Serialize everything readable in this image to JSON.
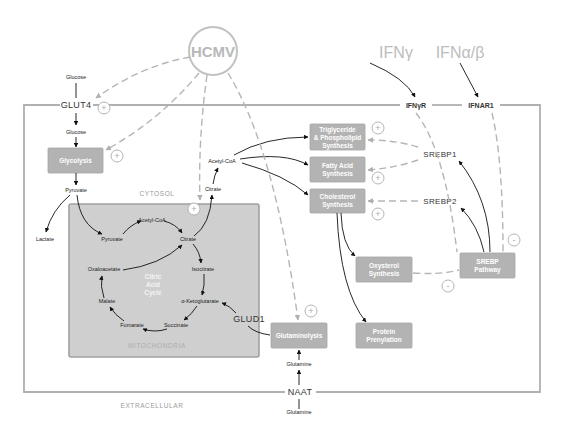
{
  "diagram": {
    "type": "metabolic-pathway",
    "colors": {
      "membrane": "#b0b0b0",
      "process_box": "#b3b3b3",
      "mitochondria_fill": "#cfcfcf",
      "arrow_solid": "#111111",
      "arrow_dashed": "#b5b5b5",
      "external_label": "#bdbdbd"
    },
    "external": {
      "virus": "HCMV",
      "ifn_gamma": "IFNγ",
      "ifn_alpha_beta": "IFNα/β",
      "glucose_in": "Glucose",
      "glutamine_in": "Glutamine"
    },
    "membrane": {
      "glut4": "GLUT4",
      "ifngr": "IFNγR",
      "ifnar1": "IFNAR1",
      "naat": "NAAT"
    },
    "regions": {
      "cytosol": "CYTOSOL",
      "mitochondria": "MITOCHONDRIA",
      "extracellular": "EXTRACELLULAR"
    },
    "cytosol": {
      "glucose": "Glucose",
      "pyruvate": "Pyruvate",
      "lactate": "Lactate",
      "citrate": "Citrate",
      "acetyl_coa": "Acetyl-CoA",
      "glutamine": "Glutamine",
      "glud1": "GLUD1",
      "srebp1": "SREBP1",
      "srebp2": "SREBP2"
    },
    "boxes": {
      "glycolysis": [
        "Glycolysis"
      ],
      "triglyceride": [
        "Triglyceride",
        "& Phospholipid",
        "Synthesis"
      ],
      "fatty_acid": [
        "Fatty Acid",
        "Synthesis"
      ],
      "cholesterol": [
        "Cholesterol",
        "Synthesis"
      ],
      "oxysterol": [
        "Oxysterol",
        "Synthesis"
      ],
      "srebp_pathway": [
        "SREBP",
        "Pathway"
      ],
      "glutaminolysis": [
        "Glutaminolysis"
      ],
      "prenylation": [
        "Protein",
        "Prenylation"
      ]
    },
    "tca": {
      "title": [
        "Citric",
        "Acid",
        "Cycle"
      ],
      "pyruvate": "Pyruvate",
      "acetyl_coa": "Acetyl-CoA",
      "citrate": "Citrate",
      "isocitrate": "Isocitrate",
      "a_ketoglutarate": "α-Ketoglutarate",
      "succinate": "Succinate",
      "fumarate": "Fumarate",
      "malate": "Malate",
      "oxaloacetate": "Oxaloacetate"
    },
    "signs": {
      "plus": "+",
      "minus": "-"
    }
  }
}
